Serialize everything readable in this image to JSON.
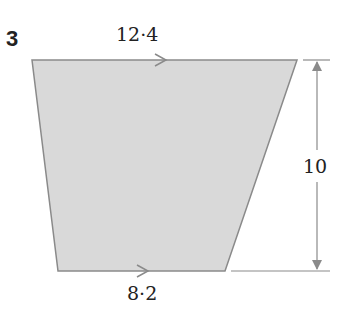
{
  "question_number": "3",
  "shape": "trapezium",
  "colors": {
    "fill": "#d9d9d9",
    "stroke": "#8a8a8a",
    "text": "#222222"
  },
  "labels": {
    "top_side": "12·4",
    "bottom_side": "8·2",
    "height": "10"
  },
  "parallel_marks": [
    "top-side-arrow",
    "bottom-side-arrow"
  ]
}
